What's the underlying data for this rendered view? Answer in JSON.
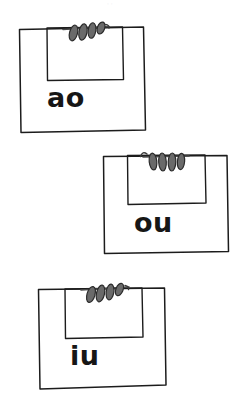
{
  "page": {
    "background_color": "#ffffff",
    "width": 243,
    "height": 401
  },
  "style": {
    "ink_color": "#1c1c1c",
    "clip_fill_color": "#6a6a6a",
    "clip_stroke_color": "#2b2b2b",
    "label_color": "#161616",
    "smudge_color": "#e9e9ec"
  },
  "artifacts": {
    "top_smudge_text": "· ·"
  },
  "cards": [
    {
      "id": "card-ao",
      "label": "ao",
      "clip_icon": "paper-clip-coil-icon",
      "order": 1,
      "position": {
        "left": 17,
        "top": 24,
        "width": 128,
        "height": 106
      },
      "label_position": {
        "left": 47,
        "top": 84
      },
      "label_size": 27
    },
    {
      "id": "card-ou",
      "label": "ou",
      "clip_icon": "paper-clip-coil-icon",
      "order": 2,
      "position": {
        "left": 101,
        "top": 152,
        "width": 128,
        "height": 100
      },
      "label_position": {
        "left": 134,
        "top": 209
      },
      "label_size": 27
    },
    {
      "id": "card-iu",
      "label": "iu",
      "clip_icon": "paper-clip-coil-icon",
      "order": 3,
      "position": {
        "left": 36,
        "top": 285,
        "width": 131,
        "height": 105
      },
      "label_position": {
        "left": 70,
        "top": 342
      },
      "label_size": 27
    }
  ]
}
